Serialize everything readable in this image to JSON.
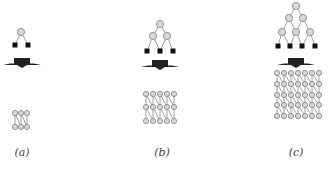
{
  "figure": {
    "panels": [
      {
        "label": "(a)",
        "cx": 22,
        "tree_rows": [
          [
            {
              "x": 21,
              "y": 32
            }
          ]
        ],
        "leaves": [
          {
            "x": 15,
            "y": 45
          },
          {
            "x": 28,
            "y": 45
          }
        ],
        "arrow_y": 58,
        "grid": {
          "cols": [
            15,
            21,
            27
          ],
          "rows": [
            113,
            127
          ]
        }
      },
      {
        "label": "(b)",
        "cx": 160,
        "tree_rows": [
          [
            {
              "x": 160,
              "y": 24
            }
          ],
          [
            {
              "x": 153,
              "y": 36
            },
            {
              "x": 167,
              "y": 36
            }
          ]
        ],
        "leaves": [
          {
            "x": 147,
            "y": 51
          },
          {
            "x": 160,
            "y": 51
          },
          {
            "x": 173,
            "y": 51
          }
        ],
        "arrow_y": 60,
        "grid": {
          "cols": [
            146,
            153,
            160,
            167,
            174
          ],
          "rows": [
            94,
            107,
            121
          ]
        }
      },
      {
        "label": "(c)",
        "cx": 296,
        "tree_rows": [
          [
            {
              "x": 296,
              "y": 6
            }
          ],
          [
            {
              "x": 289,
              "y": 18
            },
            {
              "x": 303,
              "y": 18
            }
          ],
          [
            {
              "x": 282,
              "y": 32
            },
            {
              "x": 296,
              "y": 32
            },
            {
              "x": 310,
              "y": 32
            }
          ]
        ],
        "leaves": [
          {
            "x": 278,
            "y": 46
          },
          {
            "x": 290,
            "y": 46
          },
          {
            "x": 302,
            "y": 46
          },
          {
            "x": 315,
            "y": 46
          }
        ],
        "arrow_y": 58,
        "grid": {
          "cols": [
            277,
            284,
            291,
            298,
            305,
            312,
            319
          ],
          "rows": [
            73,
            84,
            95,
            105,
            116
          ]
        }
      }
    ],
    "colors": {
      "node_fill": "#d8d8d8",
      "node_stroke": "#8a8a8a",
      "leaf": "#111111",
      "edge": "#888888",
      "arrow": "#222222"
    }
  }
}
